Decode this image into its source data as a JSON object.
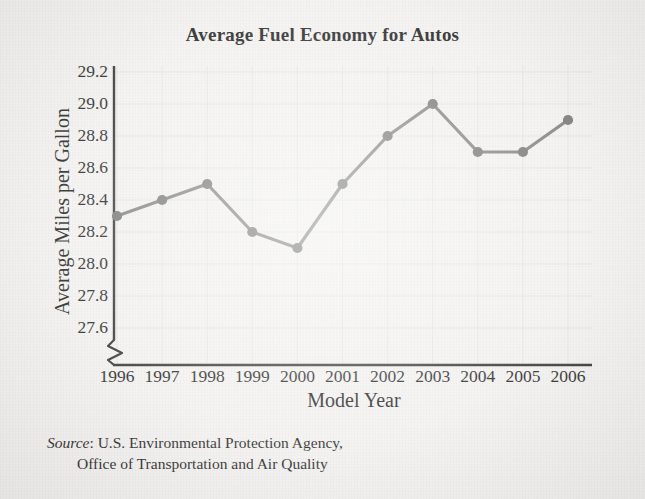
{
  "chart_data": {
    "type": "line",
    "title": "Average Fuel Economy for Autos",
    "xlabel": "Model Year",
    "ylabel": "Average Miles per Gallon",
    "categories": [
      "1996",
      "1997",
      "1998",
      "1999",
      "2000",
      "2001",
      "2002",
      "2003",
      "2004",
      "2005",
      "2006"
    ],
    "values": [
      28.3,
      28.4,
      28.5,
      28.2,
      28.1,
      28.5,
      28.8,
      29.0,
      28.7,
      28.7,
      28.9
    ],
    "ylim": [
      27.5,
      29.3
    ],
    "ytick_labels": [
      "29.2",
      "29.0",
      "28.8",
      "28.6",
      "28.4",
      "28.2",
      "28.0",
      "27.8",
      "27.6"
    ],
    "ytick_values": [
      29.2,
      29.0,
      28.8,
      28.6,
      28.4,
      28.2,
      28.0,
      27.8,
      27.6
    ],
    "grid": true,
    "legend": null,
    "axis_break": "y-axis break below 27.6",
    "line_color": "#7a7a78",
    "marker_color": "#6f6f6d",
    "axis_color": "#2b2b2b",
    "grid_color": "#e2e1de",
    "background_color": "#f2f1ef"
  },
  "source": {
    "label": "Source",
    "separator": ": ",
    "line1": "U.S. Environmental Protection Agency,",
    "line2": "Office of Transportation and Air Quality"
  }
}
